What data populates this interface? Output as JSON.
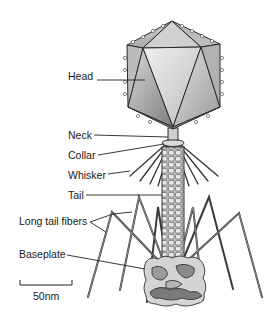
{
  "diagram": {
    "labels": {
      "head": "Head",
      "neck": "Neck",
      "collar": "Collar",
      "whisker": "Whisker",
      "tail": "Tail",
      "long_tail_fibers": "Long tail fibers",
      "baseplate": "Baseplate"
    },
    "scale_bar": {
      "label": "50nm"
    },
    "colors": {
      "background": "#ffffff",
      "outline": "#2a2a2a",
      "face_light": "#e6e6e6",
      "face_mid": "#c4c4c4",
      "face_dark": "#8c8c8c",
      "baseplate_light": "#d4d4d4",
      "baseplate_dark": "#7a7a7a",
      "leader_line": "#222222"
    }
  }
}
